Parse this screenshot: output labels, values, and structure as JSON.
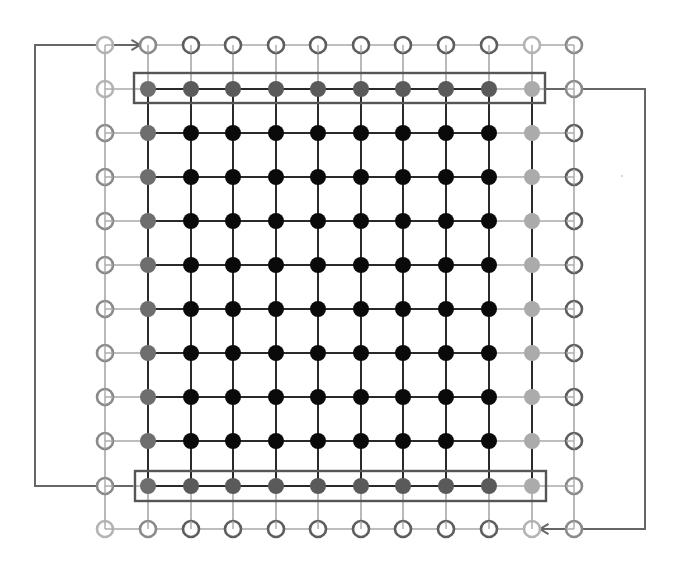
{
  "diagram": {
    "grid": {
      "cols": 12,
      "rows": 12,
      "x": [
        105,
        148,
        191,
        233,
        276,
        318,
        361,
        403,
        446,
        489,
        532,
        574
      ],
      "y": [
        45,
        89,
        133,
        177,
        221,
        265,
        309,
        353,
        397,
        441,
        486,
        529
      ],
      "node_radius": 8
    },
    "colors": {
      "interior": "#0a0a0a",
      "boundary_dark": "#5a5a5a",
      "boundary_mid": "#6e6e6e",
      "boundary_light": "#ababab",
      "ghost_dark": "#5e5e5e",
      "ghost_mid": "#8a8a8a",
      "ghost_light": "#b4b4b4",
      "interior_edge": "#2a2a2a",
      "ghost_edge": "#a8a8a8",
      "box_stroke": "#555555",
      "arrow_stroke": "#666666"
    },
    "node_legend": {
      "I": "interior node (filled black)",
      "B": "boundary node (filled dark gray)",
      "b": "boundary node corner (filled mid gray)",
      "L": "boundary node right column (filled light gray)",
      "G": "ghost node (outline dark gray)",
      "g": "ghost node (outline mid gray)",
      "l": "ghost node (outline light gray)"
    },
    "nodes": [
      "lgGGGGGGGGlg",
      "lbBBBBBBBBLg",
      "gbIIIIIIIILG",
      "gbIIIIIIIILG",
      "gbIIIIIIIILG",
      "gbIIIIIIIILG",
      "gbIIIIIIIILG",
      "gbIIIIIIIILG",
      "gbIIIIIIIILG",
      "gbIIIIIIIILG",
      "gbBBBBBBBBLg",
      "lgGGGGGGGGlg"
    ],
    "highlight_boxes": [
      {
        "name": "top-boundary-row-box",
        "x": 134,
        "y": 73,
        "width": 411,
        "height": 30
      },
      {
        "name": "bottom-boundary-row-box",
        "x": 135,
        "y": 471,
        "width": 411,
        "height": 30
      }
    ],
    "periodic_arrows": [
      {
        "name": "bottom-row-to-top-ghost-arrow",
        "points": [
          [
            133,
            486
          ],
          [
            35,
            486
          ],
          [
            35,
            45
          ],
          [
            140,
            45
          ]
        ]
      },
      {
        "name": "top-row-to-bottom-ghost-arrow",
        "points": [
          [
            545,
            89
          ],
          [
            645,
            89
          ],
          [
            645,
            529
          ],
          [
            540,
            529
          ]
        ]
      }
    ]
  }
}
